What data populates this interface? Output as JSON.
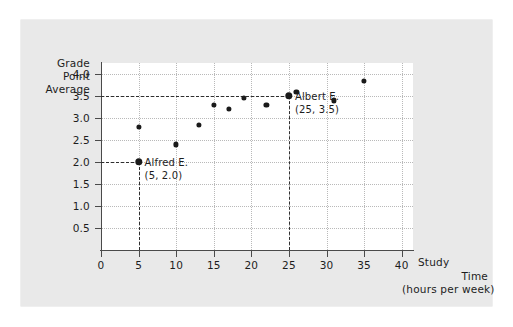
{
  "chart_data": {
    "type": "scatter",
    "title": "",
    "xlabel": "Study Time (hours per week)",
    "ylabel": "Grade Point Average",
    "xlim": [
      0,
      41.5
    ],
    "ylim": [
      0,
      4.25
    ],
    "grid": true,
    "legend": "none",
    "x_ticks": [
      0,
      5,
      10,
      15,
      20,
      25,
      30,
      35,
      40
    ],
    "x_tick_labels": [
      "0",
      "5",
      "10",
      "15",
      "20",
      "25",
      "30",
      "35",
      "40"
    ],
    "y_ticks": [
      0.5,
      1.0,
      1.5,
      2.0,
      2.5,
      3.0,
      3.5,
      4.0
    ],
    "y_tick_labels": [
      "0.5",
      "1.0",
      "1.5",
      "2.0",
      "2.5",
      "3.0",
      "3.5",
      "4.0"
    ],
    "points": [
      {
        "x": 5,
        "y": 2.8,
        "highlight": false
      },
      {
        "x": 5,
        "y": 2.0,
        "highlight": true
      },
      {
        "x": 10,
        "y": 2.4,
        "highlight": false
      },
      {
        "x": 13,
        "y": 2.85,
        "highlight": false
      },
      {
        "x": 15,
        "y": 3.3,
        "highlight": false
      },
      {
        "x": 17,
        "y": 3.2,
        "highlight": false
      },
      {
        "x": 19,
        "y": 3.45,
        "highlight": false
      },
      {
        "x": 22,
        "y": 3.3,
        "highlight": false
      },
      {
        "x": 25,
        "y": 3.5,
        "highlight": true
      },
      {
        "x": 26,
        "y": 3.6,
        "highlight": false
      },
      {
        "x": 31,
        "y": 3.4,
        "highlight": false
      },
      {
        "x": 35,
        "y": 3.85,
        "highlight": false
      }
    ],
    "annotations": [
      {
        "name": "Alfred E.",
        "coords": "(5, 2.0)",
        "x": 5,
        "y": 2.0
      },
      {
        "name": "Albert E.",
        "coords": "(25, 3.5)",
        "x": 25,
        "y": 3.5
      }
    ],
    "guide_lines": [
      {
        "orientation": "horizontal",
        "value": 2.0,
        "from_x": 0,
        "to_x": 5
      },
      {
        "orientation": "vertical",
        "value": 5,
        "from_y": 0,
        "to_y": 2.0
      },
      {
        "orientation": "horizontal",
        "value": 3.5,
        "from_x": 0,
        "to_x": 25
      },
      {
        "orientation": "vertical",
        "value": 25,
        "from_y": 0,
        "to_y": 3.5
      }
    ]
  },
  "axis": {
    "y_title_lines": [
      "Grade",
      "Point",
      "Average"
    ],
    "x_title_lines": [
      "Study",
      "Time",
      "(hours per week)"
    ]
  },
  "colors": {
    "panel_background": "#e9e9e9",
    "plot_background": "#ffffff",
    "marker": "#1a1a1a",
    "gridline": "#b9b9b9",
    "axis": "#4a4a4a",
    "text": "#1d1d1d"
  }
}
